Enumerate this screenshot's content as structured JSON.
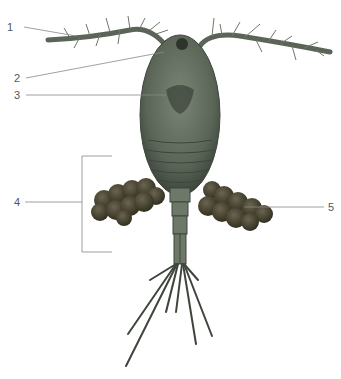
{
  "diagram": {
    "colors": {
      "body": "#5f6a5c",
      "body_dark": "#3e463c",
      "body_light": "#8c978a",
      "eggs": "#4a4534",
      "leader": "#888888",
      "label_text": "#555555"
    },
    "labels": [
      {
        "id": "1",
        "text": "1",
        "x": 7,
        "y": 22
      },
      {
        "id": "2",
        "text": "2",
        "x": 14,
        "y": 72
      },
      {
        "id": "3",
        "text": "3",
        "x": 14,
        "y": 89
      },
      {
        "id": "4",
        "text": "4",
        "x": 14,
        "y": 198
      },
      {
        "id": "5",
        "text": "5",
        "x": 328,
        "y": 204
      }
    ]
  }
}
